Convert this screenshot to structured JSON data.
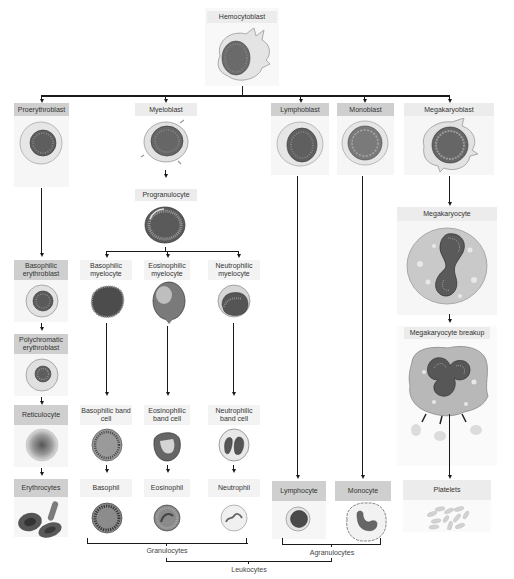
{
  "diagram": {
    "type": "hematopoiesis-lineage-tree",
    "root": {
      "label": "Hemocytoblast"
    },
    "lineages": [
      {
        "name": "erythroid",
        "stages": [
          "Proerythroblast",
          "Basophilic erythroblast",
          "Polychromatic erythroblast",
          "Reticulocyte",
          "Erythrocytes"
        ]
      },
      {
        "name": "myeloid",
        "stages": [
          "Myeloblast",
          "Progranulocyte"
        ],
        "branches": [
          {
            "stages": [
              "Basophilic myelocyte",
              "Basophilic band cell",
              "Basophil"
            ]
          },
          {
            "stages": [
              "Eosinophilic myelocyte",
              "Eosinophilic band cell",
              "Eosinophil"
            ]
          },
          {
            "stages": [
              "Neutrophilic myelocyte",
              "Neutrophilic band cell",
              "Neutrophil"
            ]
          }
        ]
      },
      {
        "name": "lymphoid",
        "stages": [
          "Lymphoblast",
          "Lymphocyte"
        ]
      },
      {
        "name": "monocytic",
        "stages": [
          "Monoblast",
          "Monocyte"
        ]
      },
      {
        "name": "megakaryocytic",
        "stages": [
          "Megakaryoblast",
          "Megakaryocyte",
          "Megakaryocyte breakup",
          "Platelets"
        ]
      }
    ],
    "groupings": [
      {
        "label": "Granulocytes",
        "members": [
          "Basophil",
          "Eosinophil",
          "Neutrophil"
        ]
      },
      {
        "label": "Agranulocytes",
        "members": [
          "Lymphocyte",
          "Monocyte"
        ]
      },
      {
        "label": "Leukocytes",
        "members": [
          "Granulocytes",
          "Agranulocytes"
        ]
      }
    ]
  },
  "labels": {
    "hemocytoblast": "Hemocytoblast",
    "proerythroblast": "Proerythroblast",
    "myeloblast": "Myeloblast",
    "lymphoblast": "Lymphoblast",
    "monoblast": "Monoblast",
    "megakaryoblast": "Megakaryoblast",
    "progranulocyte": "Progranulocyte",
    "megakaryocyte": "Megakaryocyte",
    "basophilic_erythroblast": "Basophilic erythroblast",
    "basophilic_myelocyte": "Basophilic myelocyte",
    "eosinophilic_myelocyte": "Eosinophilic myelocyte",
    "neutrophilic_myelocyte": "Neutrophilic myelocyte",
    "polychromatic_erythroblast": "Polychromatic erythroblast",
    "megakaryocyte_breakup": "Megakaryocyte breakup",
    "reticulocyte": "Reticulocyte",
    "basophilic_band_cell": "Basophilic band cell",
    "eosinophilic_band_cell": "Eosinophilic band cell",
    "neutrophilic_band_cell": "Neutrophilic band cell",
    "erythrocytes": "Erythrocytes",
    "basophil": "Basophil",
    "eosinophil": "Eosinophil",
    "neutrophil": "Neutrophil",
    "lymphocyte": "Lymphocyte",
    "monocyte": "Monocyte",
    "platelets": "Platelets",
    "granulocytes": "Granulocytes",
    "agranulocytes": "Agranulocytes",
    "leukocytes": "Leukocytes"
  },
  "colors": {
    "label_dark": "#cfcfcf",
    "label_light": "#ececec",
    "connector": "#1a1a1a",
    "cell_membrane": "#d8d8d8",
    "nucleus": "#555555"
  }
}
